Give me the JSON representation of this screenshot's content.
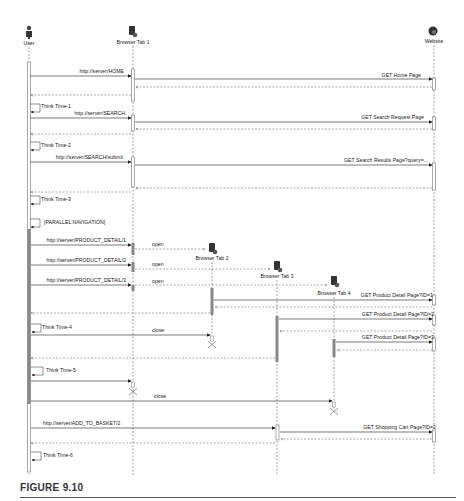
{
  "figure": {
    "caption": "FIGURE 9.10"
  },
  "participants": [
    {
      "id": "user",
      "label": "User",
      "icon": "user-icon",
      "x": 29
    },
    {
      "id": "tab1",
      "label": "Browser Tab 1",
      "icon": "browser-tab-icon",
      "x": 133
    },
    {
      "id": "tab2",
      "label": "Browser Tab 2",
      "icon": "browser-tab-icon",
      "x": 212
    },
    {
      "id": "tab3",
      "label": "Browser Tab 3",
      "icon": "browser-tab-icon",
      "x": 277
    },
    {
      "id": "tab4",
      "label": "Browser Tab 4",
      "icon": "browser-tab-icon",
      "x": 334
    },
    {
      "id": "website",
      "label": "Website",
      "icon": "globe-icon",
      "x": 434
    }
  ],
  "messages": {
    "m1": "http://server/HOME",
    "m2": "GET Home Page",
    "tt1": "Think Time-1",
    "m3": "http://server/SEARCH",
    "m4": "GET Search Request Page",
    "tt2": "Think Time-2",
    "m5": "http://server/SEARCH/submit",
    "m6": "GET Search Results Page?query=...",
    "tt3": "Think Time-3",
    "par": "[PARALLEL NAVIGATION]",
    "m7": "http://server/PRODUCT_DETAIL/1",
    "m8": "http://server/PRODUCT_DETAIL/2",
    "m9": "http://server/PRODUCT_DETAIL/3",
    "open1": "open",
    "open2": "open",
    "open3": "open",
    "m10": "GET Product Detail Page?ID=1",
    "m11": "GET Product Detail Page?ID=2",
    "m12": "GET Product Detail Page?ID=3",
    "tt4": "Think Time-4",
    "close1": "close",
    "tt5": "Think Time-5",
    "close2": "close",
    "m13": "http://server/ADD_TO_BASKET/2",
    "m14": "GET Shopping Cart Page?ID=2",
    "tt6": "Think Time-6"
  }
}
